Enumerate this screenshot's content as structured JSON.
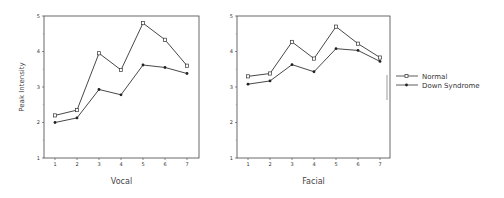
{
  "chart_data": [
    {
      "type": "line",
      "title": "",
      "xlabel": "Vocal",
      "ylabel": "Peak Intensity",
      "x": [
        1,
        2,
        3,
        4,
        5,
        6,
        7
      ],
      "ylim": [
        1,
        5
      ],
      "yticks": [
        1,
        2,
        3,
        4,
        5
      ],
      "grid": false,
      "series": [
        {
          "name": "Normal",
          "marker": "square-open",
          "values": [
            2.2,
            2.35,
            3.95,
            3.48,
            4.8,
            4.33,
            3.6
          ]
        },
        {
          "name": "Down Syndrome",
          "marker": "dot-filled",
          "values": [
            2.0,
            2.13,
            2.93,
            2.78,
            3.62,
            3.55,
            3.38
          ]
        }
      ]
    },
    {
      "type": "line",
      "title": "",
      "xlabel": "Facial",
      "ylabel": "",
      "x": [
        1,
        2,
        3,
        4,
        5,
        6,
        7
      ],
      "ylim": [
        1,
        5
      ],
      "yticks": [
        1,
        2,
        3,
        4,
        5
      ],
      "grid": false,
      "series": [
        {
          "name": "Normal",
          "marker": "square-open",
          "values": [
            3.3,
            3.38,
            4.27,
            3.8,
            4.7,
            4.22,
            3.83
          ]
        },
        {
          "name": "Down Syndrome",
          "marker": "dot-filled",
          "values": [
            3.08,
            3.17,
            3.63,
            3.43,
            4.08,
            4.03,
            3.72
          ]
        }
      ]
    }
  ],
  "legend": {
    "position": "right",
    "items": [
      {
        "label": "Normal"
      },
      {
        "label": "Down Syndrome"
      }
    ]
  }
}
